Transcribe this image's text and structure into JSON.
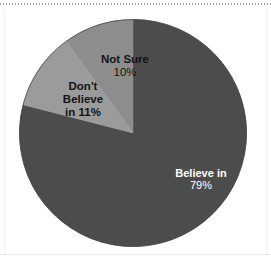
{
  "chart_data": {
    "type": "pie",
    "title": "",
    "subtitle": "",
    "xlabel": "",
    "ylabel": "",
    "legend_position": "none",
    "grid": false,
    "labels_on_slices": true,
    "start_angle_deg": 0,
    "direction": "clockwise-from-top",
    "categories": [
      "Believe in",
      "Not Sure",
      "Don't Believe in"
    ],
    "values": [
      79,
      10,
      11
    ],
    "value_unit": "%",
    "colors": [
      "#4c4c4c",
      "#8d8d8d",
      "#9b9b9b"
    ],
    "slices": [
      {
        "name": "Believe in",
        "value": 79,
        "value_text": "79%",
        "color": "#4c4c4c",
        "label_lines": [
          "Believe in"
        ],
        "label_color": "#ffffff"
      },
      {
        "name": "Not Sure",
        "value": 10,
        "value_text": "10%",
        "color": "#8d8d8d",
        "label_lines": [
          "Not Sure"
        ],
        "label_color": "#141414"
      },
      {
        "name": "Don't Believe in",
        "value": 11,
        "value_text": "in 11%",
        "color": "#9b9b9b",
        "label_lines": [
          "Don't",
          "Believe"
        ],
        "label_color": "#141414"
      }
    ]
  },
  "figure": {
    "background_color": "#ffffff",
    "pie_outline_color": "#3f3f3f"
  }
}
